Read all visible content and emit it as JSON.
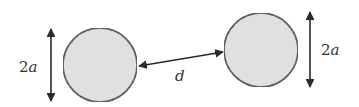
{
  "diagram": {
    "type": "two-spheres-separation",
    "colors": {
      "stroke": "#2a2a2a",
      "sphere_fill": "#e6e6e6",
      "text": "#333333"
    },
    "spheres": [
      {
        "name": "left-sphere",
        "cx": 100,
        "cy": 65,
        "r": 37
      },
      {
        "name": "right-sphere",
        "cx": 261,
        "cy": 50,
        "r": 37
      }
    ],
    "labels": {
      "left_diameter_num": "2",
      "left_diameter_var": "a",
      "right_diameter_num": "2",
      "right_diameter_var": "a",
      "separation": "d"
    },
    "arrows": {
      "left_diameter": {
        "x": 51,
        "y1": 28,
        "y2": 102
      },
      "right_diameter": {
        "x": 310,
        "y1": 12,
        "y2": 88
      },
      "separation": {
        "x1": 139,
        "y1": 66,
        "x2": 223,
        "y2": 52
      }
    }
  }
}
